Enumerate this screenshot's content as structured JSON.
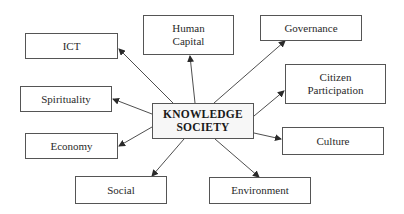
{
  "diagram": {
    "type": "hub-and-spoke",
    "center": {
      "id": "knowledge-society",
      "label": "KNOWLEDGE\nSOCIETY"
    },
    "nodes": [
      {
        "id": "ict",
        "label": "ICT"
      },
      {
        "id": "human-capital",
        "label": "Human\nCapital"
      },
      {
        "id": "governance",
        "label": "Governance"
      },
      {
        "id": "citizen-participation",
        "label": "Citizen\nParticipation"
      },
      {
        "id": "spirituality",
        "label": "Spirituality"
      },
      {
        "id": "culture",
        "label": "Culture"
      },
      {
        "id": "economy",
        "label": "Economy"
      },
      {
        "id": "social",
        "label": "Social"
      },
      {
        "id": "environment",
        "label": "Environment"
      }
    ],
    "edges_direction": "center-to-node",
    "colors": {
      "border": "#555555",
      "line": "#3a3a3a",
      "center_fill": "#f7f7f7"
    }
  }
}
